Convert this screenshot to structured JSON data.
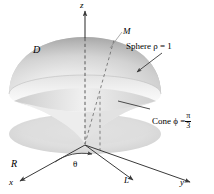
{
  "figure": {
    "type": "solid-of-revolution-diagram",
    "background_color": "#ffffff",
    "surface_color_light": "#f2f2f2",
    "surface_color_mid": "#d2d2d2",
    "surface_color_dark": "#9a9a9a",
    "line_color": "#3a3a3a",
    "axes": [
      {
        "name": "z",
        "label": "z"
      },
      {
        "name": "x",
        "label": "x"
      },
      {
        "name": "y",
        "label": "y"
      }
    ],
    "labels": {
      "z": "z",
      "x": "x",
      "y": "y",
      "M": "M",
      "D": "D",
      "R": "R",
      "L": "L",
      "theta": "θ",
      "sphere": "Sphere ρ = 1",
      "cone_prefix": "Cone ϕ =",
      "cone_fraction_numerator": "π",
      "cone_fraction_denominator": "3"
    }
  }
}
